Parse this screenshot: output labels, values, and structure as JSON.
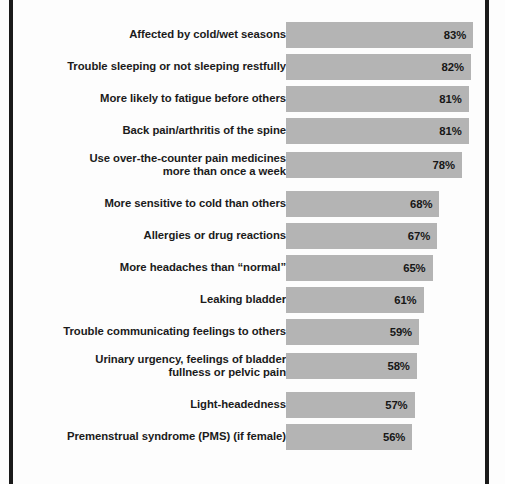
{
  "chart_data": {
    "type": "bar",
    "orientation": "horizontal",
    "title": "",
    "subtitle": "",
    "xlabel": "",
    "ylabel": "",
    "xlim": [
      0,
      100
    ],
    "grid": false,
    "legend": null,
    "value_suffix": "%",
    "categories": [
      "Affected by cold/wet seasons",
      "Trouble sleeping or not sleeping restfully",
      "More likely to fatigue before others",
      "Back pain/arthritis of the spine",
      "Use over-the-counter pain medicines\nmore than once a week",
      "More sensitive to cold than others",
      "Allergies or drug reactions",
      "More headaches than “normal”",
      "Leaking bladder",
      "Trouble communicating feelings to others",
      "Urinary urgency, feelings of bladder\nfullness or pelvic pain",
      "Light-headedness",
      "Premenstrual syndrome (PMS) (if female)"
    ],
    "values": [
      83,
      82,
      81,
      81,
      78,
      68,
      67,
      65,
      61,
      59,
      58,
      57,
      56
    ],
    "value_labels": [
      "83%",
      "82%",
      "81%",
      "81%",
      "78%",
      "68%",
      "67%",
      "65%",
      "61%",
      "59%",
      "58%",
      "57%",
      "56%"
    ],
    "bar_color": "#b4b4b4",
    "label_color": "#1b1b1b",
    "background_color": "#fdfdfd",
    "border_color": "#1a1a1a"
  },
  "rows": [
    {
      "label": "Affected by cold/wet seasons",
      "value": 83,
      "value_label": "83%",
      "top": 22,
      "lines": 1
    },
    {
      "label": "Trouble sleeping or not sleeping restfully",
      "value": 82,
      "value_label": "82%",
      "top": 54,
      "lines": 1
    },
    {
      "label": "More likely to fatigue before others",
      "value": 81,
      "value_label": "81%",
      "top": 86,
      "lines": 1
    },
    {
      "label": "Back pain/arthritis of the spine",
      "value": 81,
      "value_label": "81%",
      "top": 118,
      "lines": 1
    },
    {
      "label": "Use over-the-counter pain medicines\nmore than once a week",
      "value": 78,
      "value_label": "78%",
      "top": 152,
      "lines": 2
    },
    {
      "label": "More sensitive to cold than others",
      "value": 68,
      "value_label": "68%",
      "top": 191,
      "lines": 1
    },
    {
      "label": "Allergies or drug reactions",
      "value": 67,
      "value_label": "67%",
      "top": 223,
      "lines": 1
    },
    {
      "label": "More headaches than “normal”",
      "value": 65,
      "value_label": "65%",
      "top": 255,
      "lines": 1
    },
    {
      "label": "Leaking bladder",
      "value": 61,
      "value_label": "61%",
      "top": 287,
      "lines": 1
    },
    {
      "label": "Trouble communicating feelings to others",
      "value": 59,
      "value_label": "59%",
      "top": 319,
      "lines": 1
    },
    {
      "label": "Urinary urgency, feelings of bladder\nfullness or pelvic pain",
      "value": 58,
      "value_label": "58%",
      "top": 353,
      "lines": 2
    },
    {
      "label": "Light-headedness",
      "value": 57,
      "value_label": "57%",
      "top": 392,
      "lines": 1
    },
    {
      "label": "Premenstrual syndrome (PMS) (if female)",
      "value": 56,
      "value_label": "56%",
      "top": 424,
      "lines": 1
    }
  ],
  "scale": {
    "pixels_per_percent": 2.255,
    "zero_x": 0
  }
}
